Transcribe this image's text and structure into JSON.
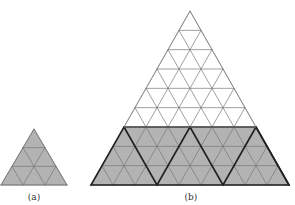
{
  "figure": {
    "panels": [
      {
        "id": "a",
        "caption": "(a)",
        "rows": 3,
        "shaded_rows": 3,
        "apex": [
          34,
          129
        ],
        "base_y": 185,
        "base_left": 6,
        "base_right": 72,
        "caption_pos": [
          34,
          192
        ]
      },
      {
        "id": "b",
        "caption": "(b)",
        "rows": 9,
        "shaded_rows": 3,
        "block_rows": 3,
        "apex": [
          190,
          11
        ],
        "base_y": 185,
        "base_left": 91,
        "base_right": 289,
        "caption_pos": [
          191,
          192
        ]
      }
    ],
    "colors": {
      "shade": "#b3b3b3",
      "thin_line": "#777777",
      "thick_line": "#222222",
      "outline_unshaded": "#888888"
    }
  }
}
